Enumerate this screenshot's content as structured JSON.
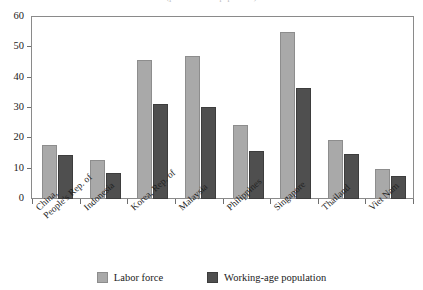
{
  "title_sliver": "(percent of total population)",
  "legend": {
    "position": "bottom",
    "items": [
      {
        "label": "Labor force",
        "color": "#a9a9a9",
        "swatch": "light"
      },
      {
        "label": "Working-age population",
        "color": "#4f4f4f",
        "swatch": "dark"
      }
    ]
  },
  "axis": {
    "y_ticks": [
      "0",
      "10",
      "20",
      "30",
      "40",
      "50",
      "60"
    ]
  },
  "chart_data": {
    "type": "bar",
    "title": "",
    "subtitle": "",
    "xlabel": "",
    "ylabel": "",
    "ylim": [
      0,
      60
    ],
    "ytick_step": 10,
    "grid": false,
    "legend_position": "bottom",
    "categories": [
      "China, People's Rep. of",
      "Indonesia",
      "Korea, Rep. of",
      "Malaysia",
      "Philippines",
      "Singapore",
      "Thailand",
      "Viet Nam"
    ],
    "category_lines": [
      [
        "China,",
        "People's Rep. of"
      ],
      [
        "Indonesia",
        ""
      ],
      [
        "Korea, Rep. of",
        ""
      ],
      [
        "Malaysia",
        ""
      ],
      [
        "Philippines",
        ""
      ],
      [
        "Singapore",
        ""
      ],
      [
        "Thailand",
        ""
      ],
      [
        "Viet Nam",
        ""
      ]
    ],
    "series": [
      {
        "name": "Labor force",
        "color": "#a9a9a9",
        "values": [
          17.7,
          12.8,
          45.9,
          47.2,
          24.3,
          55.1,
          19.3,
          9.8
        ]
      },
      {
        "name": "Working-age population",
        "color": "#4f4f4f",
        "values": [
          14.4,
          8.5,
          31.4,
          30.2,
          15.8,
          36.7,
          14.7,
          7.5
        ]
      }
    ]
  }
}
